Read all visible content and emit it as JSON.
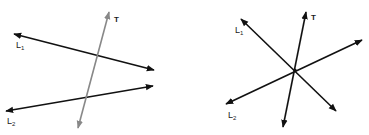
{
  "figures": [
    {
      "id": "parallel-lines-transversal",
      "description": "Two lines L1 and L2 cut by a transversal T at two distinct points",
      "labels": {
        "l1": {
          "base": "L",
          "sub": "1"
        },
        "l2": {
          "base": "L",
          "sub": "2"
        },
        "t": "T"
      },
      "colors": {
        "lines": "#111111",
        "transversal": "#888888"
      }
    },
    {
      "id": "concurrent-lines",
      "description": "Three lines L1, L2 and T intersecting at a single common point",
      "labels": {
        "l1": {
          "base": "L",
          "sub": "1"
        },
        "l2": {
          "base": "L",
          "sub": "2"
        },
        "t": "T"
      },
      "colors": {
        "lines": "#111111",
        "transversal": "#111111"
      }
    }
  ]
}
